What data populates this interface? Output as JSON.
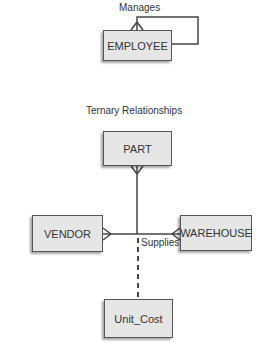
{
  "self_relationship": {
    "label": "Manages",
    "entity": "EMPLOYEE"
  },
  "ternary": {
    "title": "Ternary Relationships",
    "relationship_label": "Supplies",
    "entities": {
      "top": "PART",
      "left": "VENDOR",
      "right": "WAREHOUSE",
      "bottom": "Unit_Cost"
    }
  }
}
